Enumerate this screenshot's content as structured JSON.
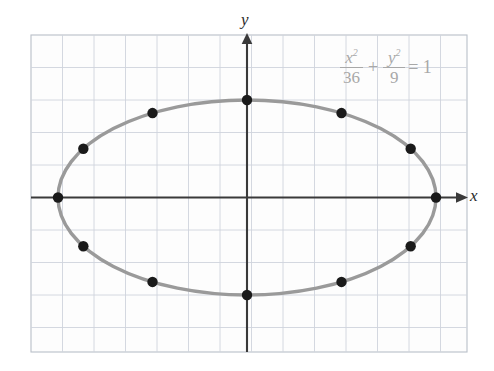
{
  "figure": {
    "background_color": "#ffffff",
    "grid": {
      "visible": true,
      "color": "#cfd4dc",
      "border_color": "#b9bfc8",
      "cell_width": 31.5,
      "cell_height": 32.5,
      "left": 31,
      "top": 35,
      "right": 467,
      "bottom": 352
    },
    "axes": {
      "color": "#3a3a3a",
      "x_label": "x",
      "y_label": "y",
      "origin_x": 247,
      "origin_y": 197.5,
      "x_axis_y": 197.5,
      "y_axis_x": 247,
      "x_axis_start": 31,
      "x_axis_end": 464,
      "y_axis_top": 37,
      "y_axis_bottom": 352
    },
    "equation": {
      "numerator_1": "x",
      "numerator_1_exp": "2",
      "denominator_1": "36",
      "operator": "+",
      "numerator_2": "y",
      "numerator_2_exp": "2",
      "denominator_2": "9",
      "equals": "= 1",
      "color": "#a8a8a8",
      "plain_text": "x^2/36 + y^2/9 = 1"
    }
  },
  "chart_data": {
    "type": "scatter",
    "title": "",
    "subtitle": "",
    "xlabel": "x",
    "ylabel": "y",
    "annotations": [
      "x²/36 + y²/9 = 1"
    ],
    "grid": true,
    "legend": null,
    "curve": {
      "name": "ellipse",
      "equation": "x^2/36 + y^2/9 = 1",
      "center": [
        0,
        0
      ],
      "semi_major_axis_a": 6,
      "semi_minor_axis_b": 3,
      "orientation": "horizontal",
      "color": "#9a9a9a",
      "line_width_px": 3.4
    },
    "points_color": "#1a1a1a",
    "point_radius_px": 5.2,
    "point_labels_visible": false,
    "x": [
      6,
      5.196,
      3,
      0,
      -3,
      -5.196,
      -6,
      -5.196,
      -3,
      0,
      3,
      5.196
    ],
    "y": [
      0,
      1.5,
      2.598,
      3,
      2.598,
      1.5,
      0,
      -1.5,
      -2.598,
      -3,
      -2.598,
      -1.5
    ],
    "points": [
      {
        "x": 6,
        "y": 0,
        "angle_deg": 0
      },
      {
        "x": 5.196,
        "y": 1.5,
        "angle_deg": 30
      },
      {
        "x": 3,
        "y": 2.598,
        "angle_deg": 60
      },
      {
        "x": 0,
        "y": 3,
        "angle_deg": 90
      },
      {
        "x": -3,
        "y": 2.598,
        "angle_deg": 120
      },
      {
        "x": -5.196,
        "y": 1.5,
        "angle_deg": 150
      },
      {
        "x": -6,
        "y": 0,
        "angle_deg": 180
      },
      {
        "x": -5.196,
        "y": -1.5,
        "angle_deg": 210
      },
      {
        "x": -3,
        "y": -2.598,
        "angle_deg": 240
      },
      {
        "x": 0,
        "y": -3,
        "angle_deg": 270
      },
      {
        "x": 3,
        "y": -2.598,
        "angle_deg": 300
      },
      {
        "x": 5.196,
        "y": -1.5,
        "angle_deg": 330
      }
    ],
    "pixel_points": [
      {
        "px": 434,
        "py": 197.5
      },
      {
        "px": 409,
        "py": 149
      },
      {
        "px": 340,
        "py": 113
      },
      {
        "px": 247,
        "py": 100
      },
      {
        "px": 154,
        "py": 113
      },
      {
        "px": 85,
        "py": 149
      },
      {
        "px": 60,
        "py": 197.5
      },
      {
        "px": 85,
        "py": 246
      },
      {
        "px": 154,
        "py": 282
      },
      {
        "px": 247,
        "py": 295
      },
      {
        "px": 340,
        "py": 282
      },
      {
        "px": 409,
        "py": 246
      }
    ],
    "xlim": [
      -6.9,
      7.0
    ],
    "ylim": [
      -4.8,
      5.0
    ],
    "x_tick_step": 1,
    "y_tick_step": 1,
    "tick_labels_visible": false
  }
}
